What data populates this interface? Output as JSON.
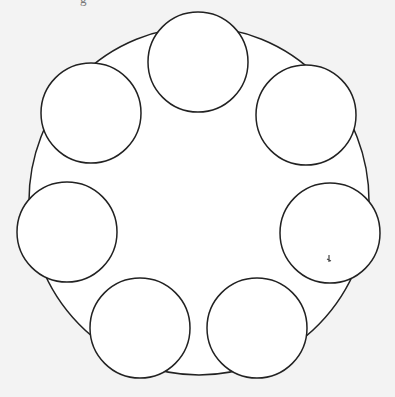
{
  "caption_fragment": "g",
  "colors": {
    "background": "#f3f3f3",
    "fill": "#ffffff",
    "stroke": "#222222"
  },
  "diagram": {
    "large_shape": {
      "type": "ellipse",
      "cx": 199,
      "cy": 201,
      "rx": 170,
      "ry": 174
    },
    "small_circles": [
      {
        "name": "top",
        "cx": 198,
        "cy": 62,
        "r": 50
      },
      {
        "name": "top-left",
        "cx": 91,
        "cy": 113,
        "r": 50
      },
      {
        "name": "top-right",
        "cx": 306,
        "cy": 115,
        "r": 50
      },
      {
        "name": "left",
        "cx": 67,
        "cy": 232,
        "r": 50
      },
      {
        "name": "right",
        "cx": 330,
        "cy": 233,
        "r": 50
      },
      {
        "name": "bottom-left",
        "cx": 140,
        "cy": 328,
        "r": 50
      },
      {
        "name": "bottom-right",
        "cx": 257,
        "cy": 328,
        "r": 50
      }
    ],
    "mark": {
      "x": 329,
      "y": 259
    }
  }
}
